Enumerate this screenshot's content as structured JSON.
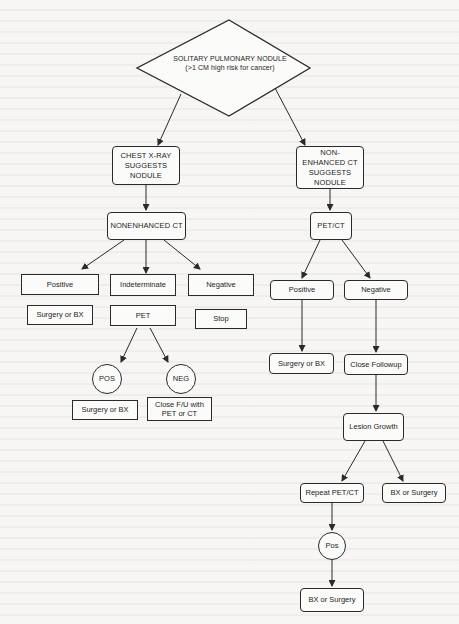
{
  "diagram": {
    "root": {
      "line1": "SOLITARY PULMONARY NODULE",
      "line2": "(>1 CM high risk for cancer)"
    },
    "left_branch": {
      "start": "CHEST X-RAY SUGGESTS NODULE",
      "test": "NONENHANCED CT",
      "results": {
        "positive": "Positive",
        "indeterminate": "Indeterminate",
        "negative": "Negative"
      },
      "actions": {
        "positive": "Surgery or BX",
        "indeterminate": "PET",
        "negative": "Stop"
      },
      "pet_outcomes": {
        "pos": "POS",
        "neg": "NEG"
      },
      "pet_actions": {
        "pos": "Surgery or BX",
        "neg": "Close F/U with PET or CT"
      }
    },
    "right_branch": {
      "start": "NON-ENHANCED CT SUGGESTS NODULE",
      "test": "PET/CT",
      "results": {
        "positive": "Positive",
        "negative": "Negative"
      },
      "actions": {
        "positive": "Surgery or BX",
        "negative": "Close Followup"
      },
      "growth": "Lesion Growth",
      "growth_actions": {
        "repeat": "Repeat PET/CT",
        "bx": "BX or Surgery"
      },
      "repeat_outcome": "Pos",
      "final": "BX or Surgery"
    },
    "colors": {
      "line": "#2a2a2a",
      "background": "#f7f6f4"
    }
  }
}
